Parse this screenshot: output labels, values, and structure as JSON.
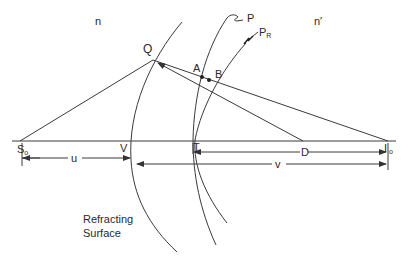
{
  "diagram": {
    "media_labels": {
      "incident": "n",
      "refracted": "n′"
    },
    "points": {
      "Q": "Q",
      "A": "A",
      "B": "B",
      "V": "V",
      "T": "T",
      "object": {
        "main": "S",
        "sub": "o"
      },
      "image": {
        "main": "I",
        "sub": "o"
      }
    },
    "wavefronts": {
      "P": "P",
      "PR": {
        "main": "P",
        "sub": "R"
      }
    },
    "distances": {
      "u": "u",
      "v": "v",
      "D": "D"
    },
    "caption": {
      "line1": "Refracting",
      "line2": "Surface"
    },
    "colors": {
      "stroke": "#3a3a3a",
      "background": "#ffffff"
    }
  }
}
